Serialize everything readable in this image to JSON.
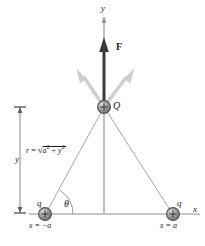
{
  "figure": {
    "type": "physics-force-diagram"
  },
  "axes": {
    "y_label": "y",
    "x_label": "x",
    "origin": {
      "x": 104,
      "y": 214
    }
  },
  "charges": [
    {
      "id": "Q",
      "label": "Q",
      "sign": "+",
      "x": 104,
      "y": 107,
      "position_label": ""
    },
    {
      "id": "q-left",
      "label": "q",
      "sign": "+",
      "x": 45,
      "y": 214,
      "position_label": "x = −a"
    },
    {
      "id": "q-right",
      "label": "q",
      "sign": "+",
      "x": 173,
      "y": 214,
      "position_label": "x = a"
    }
  ],
  "vectors": {
    "net_force": {
      "label": "F",
      "direction": "up",
      "style": "bold-black"
    },
    "component_left": {
      "label": "",
      "direction": "up-left",
      "style": "light-gray"
    },
    "component_right": {
      "label": "",
      "direction": "up-right",
      "style": "light-gray"
    }
  },
  "annotations": {
    "distance_formula_lhs": "r",
    "distance_formula_eq": "=",
    "distance_formula_radicand_a": "a",
    "distance_formula_plus": "+",
    "distance_formula_radicand_y": "y",
    "exponent": "2",
    "angle_label": "θ",
    "height_label": "y"
  },
  "colors": {
    "axis": "#8c8c8c",
    "ray": "#8c8c8c",
    "force_arrow": "#2b2b2b",
    "component_arrow": "#c9c9c9",
    "charge_fill": "#9a9a9a",
    "charge_stroke": "#4d4d4d",
    "text": "#1a1a1a",
    "dimension": "#6e6e6e",
    "background": "#ffffff"
  }
}
